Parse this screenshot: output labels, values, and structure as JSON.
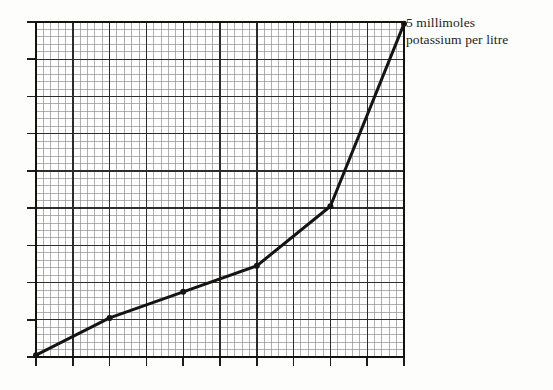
{
  "figure": {
    "title": "",
    "background_color": "#fdfdfb",
    "annotation": {
      "line1": "5 millimoles",
      "line2": "potassium per litre"
    }
  },
  "chart_data": {
    "type": "line",
    "title": "",
    "xlabel": "",
    "ylabel": "",
    "xlim": [
      0,
      10
    ],
    "ylim": [
      0,
      9
    ],
    "grid": true,
    "grid_major_color": "#2b2b2b",
    "grid_minor_color": "#8c8c8c",
    "grid_major_divisions_x": 10,
    "grid_major_divisions_y": 9,
    "grid_minor_per_major": 5,
    "axis_tick_marks": true,
    "legend": null,
    "line_color": "#161412",
    "line_width": 3,
    "marker": "dot",
    "series": [
      {
        "name": "potassium concentration",
        "x": [
          0.0,
          2.0,
          4.0,
          6.0,
          8.0,
          10.0
        ],
        "y": [
          0.05,
          1.05,
          1.75,
          2.45,
          4.05,
          8.95
        ]
      }
    ],
    "annotations": [
      {
        "text": "5 millimoles potassium per litre",
        "x": 10.0,
        "y": 8.95,
        "position": "right"
      }
    ]
  },
  "geometry": {
    "plot_left": 36,
    "plot_top": 22,
    "plot_right": 404,
    "plot_bottom": 357
  }
}
